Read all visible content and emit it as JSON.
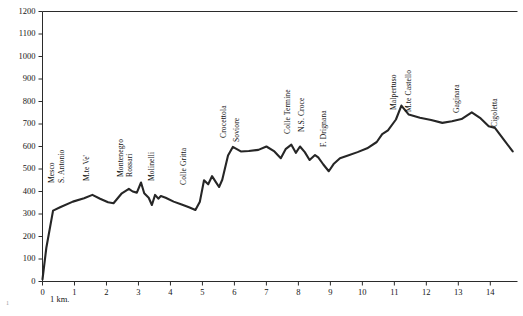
{
  "chart_data": {
    "type": "line",
    "title": "",
    "subtitle": "",
    "xlabel": "",
    "ylabel": "",
    "scale_note": "1 km.",
    "xlim": [
      0,
      14.85
    ],
    "ylim": [
      0,
      1200
    ],
    "grid": false,
    "legend": "none",
    "xticks": [
      0,
      1,
      2,
      3,
      4,
      5,
      6,
      7,
      8,
      9,
      10,
      11,
      12,
      13,
      14
    ],
    "xtick_labels": [
      "0",
      "1",
      "2",
      "3",
      "4",
      "5",
      "6",
      "7",
      "8",
      "9",
      "10",
      "11",
      "12",
      "13",
      "14"
    ],
    "yticks": [
      0,
      100,
      200,
      300,
      400,
      500,
      600,
      700,
      800,
      900,
      1000,
      1100,
      1200
    ],
    "ytick_labels": [
      "0",
      "100",
      "200",
      "300",
      "400",
      "500",
      "600",
      "700",
      "800",
      "900",
      "1000",
      "1100",
      "1200"
    ],
    "series": [
      {
        "name": "elevation-profile",
        "color": "#262626",
        "x": [
          0.0,
          0.12,
          0.33,
          0.55,
          0.95,
          1.3,
          1.56,
          1.8,
          2.05,
          2.22,
          2.48,
          2.7,
          2.82,
          2.95,
          3.08,
          3.18,
          3.32,
          3.42,
          3.52,
          3.62,
          3.7,
          3.85,
          4.1,
          4.35,
          4.58,
          4.78,
          4.92,
          5.05,
          5.18,
          5.3,
          5.42,
          5.52,
          5.62,
          5.8,
          5.95,
          6.2,
          6.45,
          6.75,
          7.0,
          7.25,
          7.45,
          7.6,
          7.78,
          7.92,
          8.05,
          8.2,
          8.35,
          8.52,
          8.62,
          8.78,
          8.95,
          9.1,
          9.3,
          9.55,
          9.85,
          10.15,
          10.45,
          10.62,
          10.8,
          11.05,
          11.22,
          11.45,
          11.8,
          12.15,
          12.5,
          12.8,
          13.1,
          13.42,
          13.7,
          13.95,
          14.15,
          14.45,
          14.7
        ],
        "y": [
          10,
          150,
          315,
          330,
          355,
          370,
          385,
          368,
          352,
          348,
          392,
          412,
          400,
          395,
          440,
          392,
          372,
          340,
          385,
          368,
          380,
          372,
          355,
          342,
          330,
          318,
          355,
          450,
          432,
          468,
          442,
          420,
          452,
          560,
          598,
          578,
          580,
          585,
          600,
          578,
          548,
          588,
          608,
          572,
          600,
          575,
          540,
          562,
          552,
          520,
          490,
          522,
          548,
          560,
          575,
          592,
          620,
          655,
          672,
          720,
          782,
          742,
          728,
          718,
          705,
          712,
          722,
          752,
          725,
          690,
          682,
          625,
          578
        ]
      }
    ],
    "annotations": [
      {
        "text": "Mesco",
        "x_px": 54,
        "y_px": 183
      },
      {
        "text": "S. Antonio",
        "x_px": 64,
        "y_px": 183
      },
      {
        "text": "M.te Ve'",
        "x_px": 89,
        "y_px": 181
      },
      {
        "text": "Montenegro",
        "x_px": 123,
        "y_px": 177
      },
      {
        "text": "Rossari",
        "x_px": 132,
        "y_px": 177
      },
      {
        "text": "Molinelli",
        "x_px": 154,
        "y_px": 181
      },
      {
        "text": "Colle Gritta",
        "x_px": 186,
        "y_px": 185
      },
      {
        "text": "Crocettola",
        "x_px": 226,
        "y_px": 138
      },
      {
        "text": "Soviore",
        "x_px": 239,
        "y_px": 142
      },
      {
        "text": "Colle Termine",
        "x_px": 290,
        "y_px": 134
      },
      {
        "text": "N.S. Croce",
        "x_px": 304,
        "y_px": 132
      },
      {
        "text": "F. Drignana",
        "x_px": 326,
        "y_px": 147
      },
      {
        "text": "Malpertuso",
        "x_px": 396,
        "y_px": 110
      },
      {
        "text": "M.te Castello",
        "x_px": 411,
        "y_px": 112
      },
      {
        "text": "Gaginara",
        "x_px": 459,
        "y_px": 113
      },
      {
        "text": "Cigoletta",
        "x_px": 497,
        "y_px": 127
      }
    ]
  },
  "figure": {
    "corner_mark": "1"
  }
}
